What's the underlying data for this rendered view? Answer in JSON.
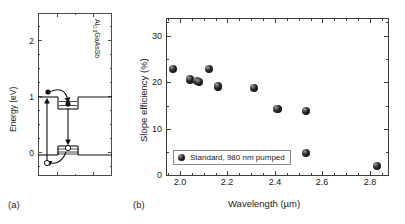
{
  "figure": {
    "panel_a_label": "(a)",
    "panel_b_label": "(b)"
  },
  "panel_a": {
    "type": "band-diagram",
    "ylabel": "Energy (eV)",
    "yticks": [
      "0",
      "1",
      "2"
    ],
    "ylim": [
      -0.45,
      2.45
    ],
    "material_label": "Al",
    "material_sub": "0.3",
    "material_label2": "GaAsSb",
    "features": [
      "conduction-band-edge",
      "quantum-well-conduction",
      "confined-electron-levels",
      "valence-band-edge",
      "quantum-well-valence",
      "confined-hole-levels",
      "electron-carrier",
      "hole-carrier",
      "pump-absorption-arrow",
      "carrier-capture-arrow",
      "radiative-recombination-arrow"
    ]
  },
  "chart_data": {
    "type": "scatter",
    "title": "",
    "xlabel": "Wavelength (µm)",
    "ylabel": "Slope efficiency (%)",
    "xlim": [
      1.88,
      2.82
    ],
    "ylim": [
      0,
      34
    ],
    "xticks": [
      "2.0",
      "2.2",
      "2.4",
      "2.6",
      "2.8"
    ],
    "xtick_values": [
      2.0,
      2.2,
      2.4,
      2.6,
      2.8
    ],
    "xminor_step": 0.05,
    "yticks": [
      "0",
      "10",
      "20",
      "30"
    ],
    "ytick_values": [
      0,
      10,
      20,
      30
    ],
    "yminor_step": 5,
    "grid": false,
    "legend_position": "lower left",
    "series": [
      {
        "name": "Standard, 980 nm pumped",
        "marker": "filled-sphere",
        "color": "#111111",
        "x": [
          1.91,
          1.98,
          2.01,
          2.02,
          2.06,
          2.1,
          2.25,
          2.35,
          2.47,
          2.47,
          2.77
        ],
        "y": [
          23.0,
          20.8,
          20.5,
          20.2,
          23.0,
          19.3,
          19.0,
          14.4,
          14.0,
          5.0,
          2.2
        ]
      }
    ]
  }
}
